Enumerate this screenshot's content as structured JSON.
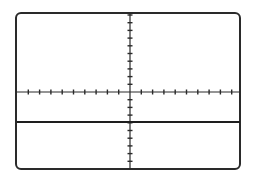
{
  "figure": {
    "type": "oscilloscope-screen",
    "colors": {
      "line": "#2a2a2a",
      "background": "#ffffff"
    },
    "graticule": {
      "center": [
        130,
        92
      ],
      "horizontal_ticks_per_side": 9,
      "horizontal_tick_spacing_px": 11.3,
      "vertical_ticks_per_side": 10,
      "vertical_tick_spacing_px": 7.7
    },
    "trace": {
      "shape": "flat-line",
      "y_px": 122,
      "x_start_px": 17,
      "x_end_px": 240
    }
  }
}
